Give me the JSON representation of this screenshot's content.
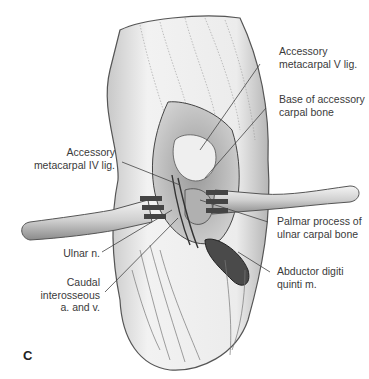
{
  "figure": {
    "panel_letter": "C",
    "labels": {
      "acc_meta_v": [
        "Accessory",
        "metacarpal V lig."
      ],
      "base_acc_carpal": [
        "Base of accessory",
        "carpal bone"
      ],
      "acc_meta_iv": [
        "Accessory",
        "metacarpal IV lig."
      ],
      "palmar_process": [
        "Palmar process of",
        "ulnar carpal bone"
      ],
      "ulnar_n": [
        "Ulnar n."
      ],
      "caudal_interosseous": [
        "Caudal",
        "interosseous",
        "a. and v."
      ],
      "abductor": [
        "Abductor digiti",
        "quinti m."
      ]
    }
  }
}
